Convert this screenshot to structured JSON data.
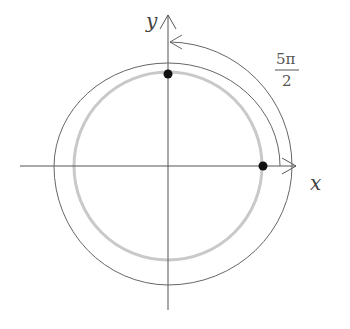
{
  "labels": {
    "x_axis": "x",
    "y_axis": "y",
    "angle_numerator": "5π",
    "angle_denominator": "2"
  },
  "diagram": {
    "origin": [
      168,
      166
    ],
    "circle_radius": 94,
    "points": [
      {
        "name": "start-point",
        "x": 263,
        "y": 166
      },
      {
        "name": "end-point",
        "x": 168,
        "y": 74
      }
    ],
    "colors": {
      "axis": "#555555",
      "circle": "#c8c8c8",
      "spiral": "#666666",
      "point": "#111111"
    }
  }
}
